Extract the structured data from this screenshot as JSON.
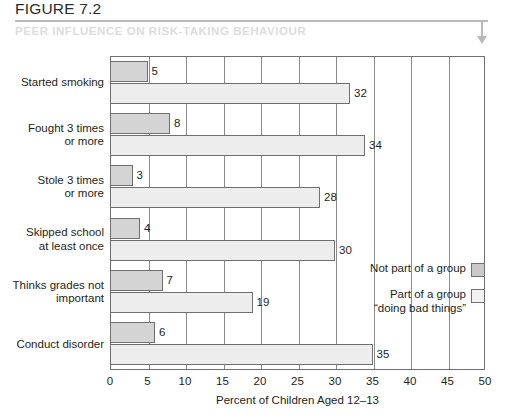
{
  "header": {
    "figure_number": "FIGURE 7.2",
    "subtitle": "PEER INFLUENCE ON RISK-TAKING BEHAVIOUR",
    "arrow_icon": "arrow-down-icon"
  },
  "legend": {
    "items": [
      {
        "label": "Not part of a group",
        "swatch_color": "#c9c9c9"
      },
      {
        "label": "Part of a group\n“doing bad things”",
        "swatch_color": "#f2f2f2"
      }
    ]
  },
  "chart_data": {
    "type": "bar",
    "orientation": "horizontal",
    "title": "PEER INFLUENCE ON RISK-TAKING BEHAVIOUR",
    "xlabel": "Percent of Children Aged 12–13",
    "ylabel": "",
    "xlim": [
      0,
      50
    ],
    "xticks": [
      0,
      5,
      10,
      15,
      20,
      25,
      30,
      35,
      40,
      45,
      50
    ],
    "xtick_labels": [
      "0",
      "5",
      "10",
      "15",
      "20",
      "25",
      "30",
      "35",
      "40",
      "45",
      "50"
    ],
    "grid": true,
    "legend_position": "inside-right",
    "categories": [
      "Started smoking",
      "Fought 3 times\nor more",
      "Stole 3 times\nor more",
      "Skipped school\nat least once",
      "Thinks grades not\nimportant",
      "Conduct disorder"
    ],
    "series": [
      {
        "name": "Not part of a group",
        "color": "#d4d4d4",
        "values": [
          5,
          8,
          3,
          4,
          7,
          6
        ]
      },
      {
        "name": "Part of a group “doing bad things”",
        "color": "#ededed",
        "values": [
          32,
          34,
          28,
          30,
          19,
          35
        ]
      }
    ]
  }
}
